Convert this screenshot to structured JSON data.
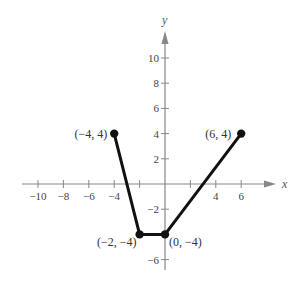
{
  "chart_data": {
    "type": "line",
    "title": "",
    "xlabel": "x",
    "ylabel": "y",
    "xlim": [
      -11,
      8
    ],
    "ylim": [
      -7,
      12
    ],
    "grid": false,
    "x_ticks": [
      -10,
      -8,
      -6,
      -4,
      -2,
      0,
      2,
      4,
      6
    ],
    "x_tick_labels": [
      "-10",
      "-8",
      "-6",
      "-4",
      "",
      "",
      "",
      "4",
      "6"
    ],
    "y_ticks": [
      -6,
      -4,
      -2,
      2,
      4,
      6,
      8,
      10
    ],
    "y_tick_labels": [
      "-6",
      "",
      "-2",
      "2",
      "4",
      "6",
      "8",
      "10"
    ],
    "series": [
      {
        "name": "piecewise",
        "color": "#111111",
        "points": [
          {
            "x": -4,
            "y": 4
          },
          {
            "x": -2,
            "y": -4
          },
          {
            "x": 0,
            "y": -4
          },
          {
            "x": 6,
            "y": 4
          }
        ]
      }
    ],
    "annotations": [
      {
        "text": "(−4, 4)",
        "x": -4,
        "y": 4,
        "anchor": "end",
        "dx": -7,
        "dy": 4
      },
      {
        "text": "(6, 4)",
        "x": 6,
        "y": 4,
        "anchor": "end",
        "dx": -10,
        "dy": 4
      },
      {
        "text": "(−2, −4)",
        "x": -2,
        "y": -4,
        "anchor": "end",
        "dx": -3,
        "dy": 12
      },
      {
        "text": "(0, −4)",
        "x": 0,
        "y": -4,
        "anchor": "start",
        "dx": 4,
        "dy": 12
      }
    ]
  },
  "colors": {
    "axis": "#888888",
    "line": "#111111",
    "text": "#444444"
  }
}
